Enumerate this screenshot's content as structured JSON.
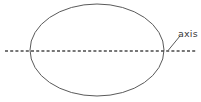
{
  "figure": {
    "background_color": "#ffffff",
    "width": 201,
    "height": 102
  },
  "shapes": {
    "ellipse": {
      "name": "ellipse-outline",
      "center_x": 97,
      "center_y": 50,
      "radius_x": 67,
      "radius_y": 46,
      "stroke_color": "#5a5a5a",
      "stroke_width": 1,
      "fill": "none"
    },
    "axis_line": {
      "name": "axis-of-symmetry",
      "x1": 5,
      "y1": 51,
      "x2": 196,
      "y2": 51,
      "stroke_color": "#4a4a4a",
      "stroke_width": 1.4,
      "dash_length": 3,
      "gap_length": 2.2,
      "style": "dashed"
    },
    "leader_line": {
      "name": "label-leader-line",
      "x1": 168.5,
      "y1": 50,
      "x2": 180,
      "y2": 36,
      "stroke_color": "#5a5a5a",
      "stroke_width": 1
    }
  },
  "labels": {
    "axis": {
      "text": "axis",
      "x": 178,
      "y": 37,
      "color": "#3a3a3a",
      "font_size": "9.5px"
    }
  }
}
